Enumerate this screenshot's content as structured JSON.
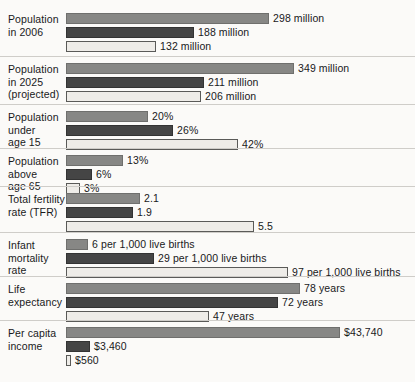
{
  "chart_data": {
    "type": "bar",
    "title": "",
    "subtitle": "",
    "xlabel": "",
    "ylabel": "",
    "orientation": "horizontal",
    "grid": false,
    "legend_position": "none",
    "series": [
      {
        "name": "series-1",
        "color": "#878785"
      },
      {
        "name": "series-2",
        "color": "#454545"
      },
      {
        "name": "series-3",
        "color": "#eeece8"
      }
    ],
    "categories": [
      "Population in 2006",
      "Population in 2025 (projected)",
      "Population under age 15",
      "Population above age 65",
      "Total fertility rate (TFR)",
      "Infant mortality rate",
      "Life expectancy",
      "Per capita income"
    ],
    "groups": [
      {
        "label_lines": [
          "Population",
          "in 2006"
        ],
        "bars": [
          {
            "series": 0,
            "value": 298,
            "unit": "million",
            "label": "298 million",
            "width_px": 203
          },
          {
            "series": 1,
            "value": 188,
            "unit": "million",
            "label": "188 million",
            "width_px": 128
          },
          {
            "series": 2,
            "value": 132,
            "unit": "million",
            "label": "132 million",
            "width_px": 90
          }
        ]
      },
      {
        "label_lines": [
          "Population",
          "in 2025",
          "(projected)"
        ],
        "bars": [
          {
            "series": 0,
            "value": 349,
            "unit": "million",
            "label": "349 million",
            "width_px": 228
          },
          {
            "series": 1,
            "value": 211,
            "unit": "million",
            "label": "211 million",
            "width_px": 138
          },
          {
            "series": 2,
            "value": 206,
            "unit": "million",
            "label": "206 million",
            "width_px": 135
          }
        ]
      },
      {
        "label_lines": [
          "Population",
          "under",
          "age 15"
        ],
        "bars": [
          {
            "series": 0,
            "value": 20,
            "unit": "%",
            "label": "20%",
            "width_px": 82
          },
          {
            "series": 1,
            "value": 26,
            "unit": "%",
            "label": "26%",
            "width_px": 107
          },
          {
            "series": 2,
            "value": 42,
            "unit": "%",
            "label": "42%",
            "width_px": 172
          }
        ]
      },
      {
        "label_lines": [
          "Population",
          "above",
          "age 65"
        ],
        "bars": [
          {
            "series": 0,
            "value": 13,
            "unit": "%",
            "label": "13%",
            "width_px": 57
          },
          {
            "series": 1,
            "value": 6,
            "unit": "%",
            "label": "6%",
            "width_px": 26
          },
          {
            "series": 2,
            "value": 3,
            "unit": "%",
            "label": "3%",
            "width_px": 14
          }
        ]
      },
      {
        "label_lines": [
          "Total fertility",
          "rate (TFR)"
        ],
        "bars": [
          {
            "series": 0,
            "value": 2.1,
            "unit": "",
            "label": "2.1",
            "width_px": 74
          },
          {
            "series": 1,
            "value": 1.9,
            "unit": "",
            "label": "1.9",
            "width_px": 67
          },
          {
            "series": 2,
            "value": 5.5,
            "unit": "",
            "label": "5.5",
            "width_px": 188
          }
        ]
      },
      {
        "label_lines": [
          "Infant",
          "mortality",
          "rate"
        ],
        "bars": [
          {
            "series": 0,
            "value": 6,
            "unit": "per 1,000 live births",
            "label": "6 per 1,000 live births",
            "width_px": 22
          },
          {
            "series": 1,
            "value": 29,
            "unit": "per 1,000 live births",
            "label": "29 per 1,000 live births",
            "width_px": 88
          },
          {
            "series": 2,
            "value": 97,
            "unit": "per 1,000 live births",
            "label": "97 per 1,000 live births",
            "width_px": 222
          }
        ]
      },
      {
        "label_lines": [
          "Life",
          "expectancy"
        ],
        "bars": [
          {
            "series": 0,
            "value": 78,
            "unit": "years",
            "label": "78 years",
            "width_px": 234
          },
          {
            "series": 1,
            "value": 72,
            "unit": "years",
            "label": "72 years",
            "width_px": 212
          },
          {
            "series": 2,
            "value": 47,
            "unit": "years",
            "label": "47 years",
            "width_px": 143
          }
        ]
      },
      {
        "label_lines": [
          "Per capita",
          "income"
        ],
        "bars": [
          {
            "series": 0,
            "value": 43740,
            "unit": "$",
            "label": "$43,740",
            "width_px": 274
          },
          {
            "series": 1,
            "value": 3460,
            "unit": "$",
            "label": "$3,460",
            "width_px": 24
          },
          {
            "series": 2,
            "value": 560,
            "unit": "$",
            "label": "$560",
            "width_px": 5
          }
        ]
      }
    ]
  },
  "style": {
    "background": "#fbfaf8",
    "text_color": "#19191b",
    "separator_color": "#cfcdc9"
  }
}
